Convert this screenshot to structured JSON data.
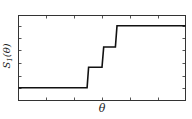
{
  "chart_data": {
    "type": "line",
    "title": "",
    "xlabel": "θ",
    "ylabel": "S₁(θ)",
    "xlim": [
      0,
      1
    ],
    "ylim": [
      0,
      1
    ],
    "grid": false,
    "legend": null,
    "tick_labels": false,
    "series": [
      {
        "name": "S1",
        "x": [
          0.0,
          0.411,
          0.42,
          0.5,
          0.51,
          0.58,
          0.59,
          1.0
        ],
        "y": [
          0.15,
          0.15,
          0.39,
          0.39,
          0.63,
          0.63,
          0.88,
          0.88
        ]
      }
    ],
    "x_ticks": [
      0.167,
      0.333,
      0.5,
      0.667,
      0.833
    ],
    "y_ticks": [
      0.15,
      0.29,
      0.44,
      0.59,
      0.73,
      0.88
    ]
  },
  "labels": {
    "x": "θ",
    "y_main": "S",
    "y_sub": "1",
    "y_arg": "(θ)"
  }
}
